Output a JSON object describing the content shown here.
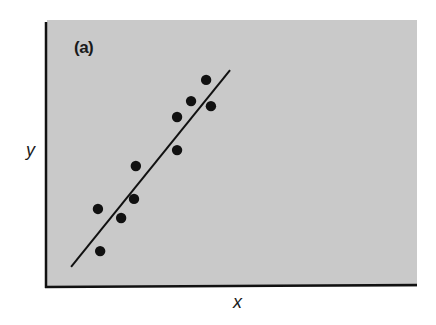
{
  "chart_data": {
    "type": "scatter",
    "title": "(a)",
    "panel_label": "(a)",
    "xlabel": "x",
    "ylabel": "y",
    "xlim": [
      0,
      10
    ],
    "ylim": [
      0,
      10
    ],
    "grid": false,
    "legend": null,
    "background_color": "#c9c9c9",
    "point_color": "#111111",
    "line_color": "#111111",
    "series": [
      {
        "name": "observations",
        "kind": "scatter",
        "points": [
          {
            "x": 1.33,
            "y": 2.87
          },
          {
            "x": 1.39,
            "y": 1.28
          },
          {
            "x": 1.96,
            "y": 2.53
          },
          {
            "x": 2.31,
            "y": 3.25
          },
          {
            "x": 2.36,
            "y": 4.49
          },
          {
            "x": 3.48,
            "y": 5.09
          },
          {
            "x": 3.48,
            "y": 6.34
          },
          {
            "x": 3.86,
            "y": 6.94
          },
          {
            "x": 4.27,
            "y": 7.74
          },
          {
            "x": 4.4,
            "y": 6.75
          }
        ]
      },
      {
        "name": "fitted line",
        "kind": "line",
        "points": [
          {
            "x": 0.6,
            "y": 0.68
          },
          {
            "x": 4.92,
            "y": 8.11
          }
        ]
      }
    ],
    "annotations": [
      "Strong positive linear correlation"
    ]
  },
  "labels": {
    "panel": "(a)",
    "x_axis": "x",
    "y_axis": "y"
  }
}
